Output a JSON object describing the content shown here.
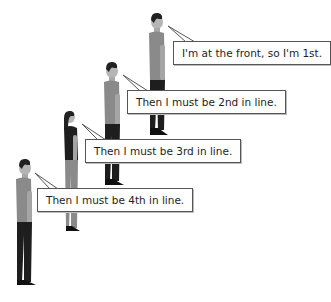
{
  "figure": {
    "people": [
      {
        "position": 1,
        "type": "man",
        "speech": "I'm at the front, so I'm 1st."
      },
      {
        "position": 2,
        "type": "man",
        "speech": "Then I must be 2nd in line."
      },
      {
        "position": 3,
        "type": "woman",
        "speech": "Then I must be 3rd in line."
      },
      {
        "position": 4,
        "type": "man",
        "speech": "Then I must be 4th in line."
      }
    ]
  },
  "colors": {
    "shirt": "#8a8a8a",
    "pants": "#1e1e1e",
    "hair": "#222222",
    "skin": "#b5b5b5",
    "bubble_border": "#555555",
    "background": "#ffffff"
  }
}
